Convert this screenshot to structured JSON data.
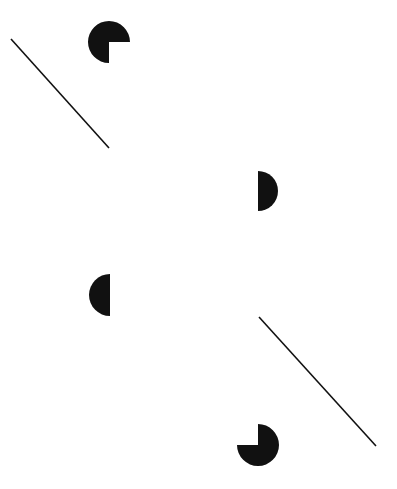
{
  "figure": {
    "type": "illusory-contour",
    "ink_color": "#111111",
    "background": "#ffffff",
    "lines": [
      {
        "name": "upper-left-line",
        "x1": 11,
        "y1": 39,
        "x2": 109,
        "y2": 148
      },
      {
        "name": "lower-right-line",
        "x1": 259,
        "y1": 317,
        "x2": 376,
        "y2": 446
      }
    ],
    "shapes": [
      {
        "name": "top-pacman",
        "kind": "pacman",
        "cx": 109,
        "cy": 42,
        "r": 21,
        "missing_quadrant": "bottom-right"
      },
      {
        "name": "right-half-disc",
        "kind": "half-disc",
        "cx": 258,
        "cy": 191,
        "r": 20,
        "side": "right"
      },
      {
        "name": "left-half-disc",
        "kind": "half-disc",
        "cx": 110,
        "cy": 295,
        "r": 21,
        "side": "left"
      },
      {
        "name": "bottom-pacman",
        "kind": "pacman",
        "cx": 258,
        "cy": 445,
        "r": 21,
        "missing_quadrant": "top-left"
      }
    ]
  }
}
